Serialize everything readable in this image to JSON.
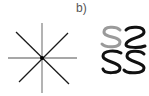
{
  "panel": {
    "label": "b)"
  },
  "figure": {
    "star": {
      "description": "eight-spoke star of crossing lines",
      "center": [
        42,
        58
      ],
      "colors": {
        "axis_lines": "#8a8a8a",
        "diagonal_lines": "#1a1a1a",
        "center": "#000000"
      }
    },
    "glyphs": {
      "description": "S-shaped glyphs: one gray S plus mirrored/rotated black S variants",
      "colors": {
        "gray_s": "#9a9a9a",
        "black_s": "#111111"
      }
    }
  }
}
